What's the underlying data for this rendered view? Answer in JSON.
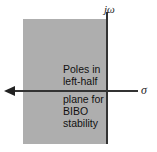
{
  "diagram": {
    "type": "s-plane stability region",
    "axes": {
      "vertical_label": "jω",
      "horizontal_label": "σ"
    },
    "shaded_region": {
      "description": "left-half plane",
      "color": "#aeaeae"
    },
    "annotation": {
      "line1": "Poles in",
      "line2": "left-half",
      "line3": "plane for",
      "line4": "BIBO",
      "line5": "stability"
    }
  }
}
